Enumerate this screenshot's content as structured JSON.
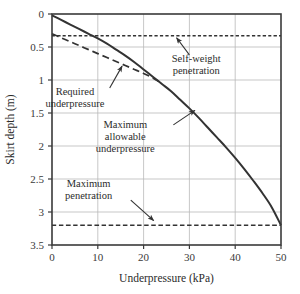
{
  "chart_data": {
    "type": "line",
    "title": "",
    "xlabel": "Underpressure (kPa)",
    "ylabel": "Skirt depth (m)",
    "xlim": [
      0,
      50
    ],
    "ylim": [
      0,
      3.5
    ],
    "y_axis_inverted": true,
    "grid": true,
    "legend_position": "none",
    "xticks": [
      "0",
      "10",
      "20",
      "30",
      "40",
      "50"
    ],
    "xtick_values": [
      0,
      10,
      20,
      30,
      40,
      50
    ],
    "yticks": [
      "0",
      "0.5",
      "1",
      "1.5",
      "2",
      "2.5",
      "3",
      "3.5"
    ],
    "ytick_values": [
      0,
      0.5,
      1,
      1.5,
      2,
      2.5,
      3,
      3.5
    ],
    "series": [
      {
        "name": "Maximum allowable underpressure",
        "style": "solid",
        "color": "#333333",
        "x": [
          0,
          2,
          4,
          6,
          8,
          10,
          12,
          14,
          16,
          18,
          20,
          22,
          24,
          26,
          28,
          30,
          32,
          34,
          36,
          38,
          40,
          42,
          44,
          46,
          48,
          50
        ],
        "y": [
          0.02,
          0.09,
          0.16,
          0.23,
          0.3,
          0.37,
          0.45,
          0.54,
          0.63,
          0.73,
          0.84,
          0.95,
          1.06,
          1.17,
          1.3,
          1.43,
          1.57,
          1.72,
          1.87,
          2.02,
          2.18,
          2.35,
          2.53,
          2.72,
          2.93,
          3.2
        ]
      },
      {
        "name": "Required underpressure",
        "style": "dashed",
        "color": "#333333",
        "x": [
          0,
          2,
          4,
          6,
          8,
          10,
          12,
          14,
          16,
          18,
          20,
          22,
          24
        ],
        "y": [
          0.3,
          0.36,
          0.42,
          0.48,
          0.54,
          0.6,
          0.66,
          0.72,
          0.78,
          0.84,
          0.9,
          0.97,
          1.05
        ]
      },
      {
        "name": "Self-weight penetration",
        "style": "dotted-horizontal",
        "color": "#333333",
        "x": [
          0,
          50
        ],
        "y": [
          0.33,
          0.33
        ]
      },
      {
        "name": "Maximum penetration",
        "style": "dashed-horizontal",
        "color": "#333333",
        "x": [
          0,
          50
        ],
        "y": [
          3.2,
          3.2
        ]
      }
    ],
    "annotations": [
      {
        "id": "self-weight-penetration",
        "lines": [
          "Self-weight",
          "penetration"
        ],
        "text_x": 31.5,
        "text_y": 0.72,
        "arrow_from_x": 30.0,
        "arrow_from_y": 0.62,
        "arrow_to_x": 27.2,
        "arrow_to_y": 0.36
      },
      {
        "id": "required-underpressure",
        "lines": [
          "Required",
          "underpressure"
        ],
        "text_x": 5.0,
        "text_y": 1.22,
        "arrow_from_x": 12.6,
        "arrow_from_y": 1.12,
        "arrow_to_x": 15.3,
        "arrow_to_y": 0.79
      },
      {
        "id": "maximum-allowable-underpressure",
        "lines": [
          "Maximum",
          "allowable",
          "underpressure"
        ],
        "text_x": 16.0,
        "text_y": 1.73,
        "arrow_from_x": 26.5,
        "arrow_from_y": 1.68,
        "arrow_to_x": 31.2,
        "arrow_to_y": 1.46
      },
      {
        "id": "maximum-penetration",
        "lines": [
          "Maximum",
          "penetration"
        ],
        "text_x": 8.0,
        "text_y": 2.62,
        "arrow_from_x": 17.2,
        "arrow_from_y": 2.82,
        "arrow_to_x": 22.2,
        "arrow_to_y": 3.13
      }
    ],
    "colors": {
      "curve": "#333333",
      "grid": "#b9b9b9",
      "frame": "#3a3a3a",
      "text": "#2b2b2b",
      "background": "#ffffff"
    }
  }
}
